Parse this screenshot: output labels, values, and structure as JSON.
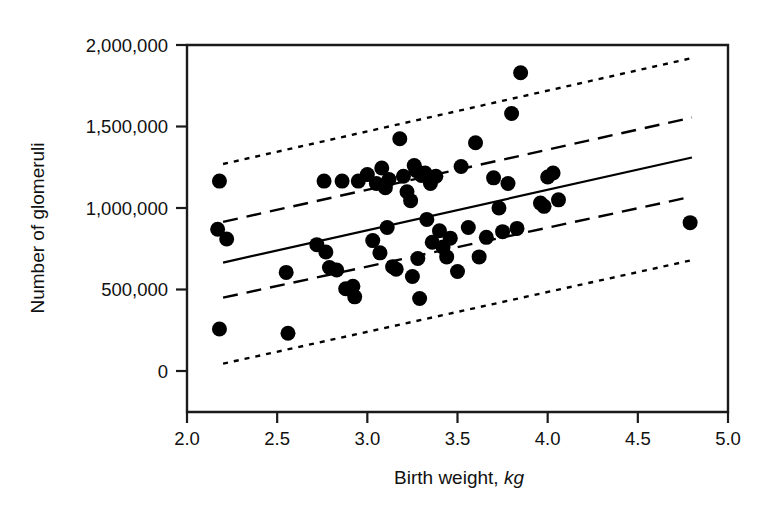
{
  "chart_data": {
    "type": "scatter",
    "title": "",
    "xlabel": "Birth weight, kg",
    "xlabel_main": "Birth weight,",
    "xlabel_unit": "kg",
    "ylabel": "Number of glomeruli",
    "xlim": [
      2.0,
      5.0
    ],
    "ylim": [
      0,
      2000000
    ],
    "xticks": [
      2.0,
      2.5,
      3.0,
      3.5,
      4.0,
      4.5,
      5.0
    ],
    "xticklabels": [
      "2.0",
      "2.5",
      "3.0",
      "3.5",
      "4.0",
      "4.5",
      "5.0"
    ],
    "yticks": [
      0,
      500000,
      1000000,
      1500000,
      2000000
    ],
    "yticklabels": [
      "0",
      "500,000",
      "1,000,000",
      "1,500,000",
      "2,000,000"
    ],
    "grid": false,
    "legend": null,
    "marker_color": "#000000",
    "marker_radius": 7.5,
    "points": [
      [
        2.18,
        1165000
      ],
      [
        2.17,
        870000
      ],
      [
        2.22,
        810000
      ],
      [
        2.18,
        258000
      ],
      [
        2.55,
        605000
      ],
      [
        2.56,
        232000
      ],
      [
        2.72,
        775000
      ],
      [
        2.76,
        1165000
      ],
      [
        2.77,
        730000
      ],
      [
        2.79,
        635000
      ],
      [
        2.83,
        620000
      ],
      [
        2.86,
        1165000
      ],
      [
        2.88,
        505000
      ],
      [
        2.92,
        520000
      ],
      [
        2.93,
        455000
      ],
      [
        2.95,
        1165000
      ],
      [
        3.0,
        1205000
      ],
      [
        3.03,
        800000
      ],
      [
        3.05,
        1150000
      ],
      [
        3.07,
        725000
      ],
      [
        3.08,
        1245000
      ],
      [
        3.1,
        1125000
      ],
      [
        3.11,
        880000
      ],
      [
        3.12,
        1175000
      ],
      [
        3.14,
        640000
      ],
      [
        3.16,
        625000
      ],
      [
        3.18,
        1425000
      ],
      [
        3.2,
        1195000
      ],
      [
        3.22,
        1100000
      ],
      [
        3.24,
        1045000
      ],
      [
        3.25,
        580000
      ],
      [
        3.26,
        1260000
      ],
      [
        3.27,
        1230000
      ],
      [
        3.28,
        690000
      ],
      [
        3.29,
        445000
      ],
      [
        3.3,
        1200000
      ],
      [
        3.32,
        1215000
      ],
      [
        3.33,
        930000
      ],
      [
        3.35,
        1150000
      ],
      [
        3.36,
        790000
      ],
      [
        3.38,
        1195000
      ],
      [
        3.4,
        860000
      ],
      [
        3.42,
        760000
      ],
      [
        3.44,
        700000
      ],
      [
        3.46,
        815000
      ],
      [
        3.5,
        610000
      ],
      [
        3.52,
        1255000
      ],
      [
        3.56,
        880000
      ],
      [
        3.6,
        1400000
      ],
      [
        3.62,
        700000
      ],
      [
        3.66,
        820000
      ],
      [
        3.7,
        1185000
      ],
      [
        3.73,
        1000000
      ],
      [
        3.75,
        855000
      ],
      [
        3.78,
        1150000
      ],
      [
        3.8,
        1580000
      ],
      [
        3.83,
        875000
      ],
      [
        3.85,
        1830000
      ],
      [
        3.96,
        1030000
      ],
      [
        3.98,
        1010000
      ],
      [
        4.0,
        1190000
      ],
      [
        4.03,
        1215000
      ],
      [
        4.06,
        1050000
      ],
      [
        4.79,
        910000
      ]
    ],
    "regression_line": {
      "name": "fitted-regression-line",
      "style": "solid",
      "x_start": 2.2,
      "y_start": 665000,
      "x_end": 4.8,
      "y_end": 1310000
    },
    "confidence_band": {
      "name": "confidence-interval",
      "style": "dashed",
      "upper": {
        "x_start": 2.2,
        "y_start": 915000,
        "x_end": 4.8,
        "y_end": 1555000
      },
      "lower": {
        "x_start": 2.2,
        "y_start": 450000,
        "x_end": 4.8,
        "y_end": 1070000
      }
    },
    "prediction_band": {
      "name": "prediction-interval",
      "style": "dotted",
      "upper": {
        "x_start": 2.2,
        "y_start": 1270000,
        "x_end": 4.8,
        "y_end": 1920000
      },
      "lower": {
        "x_start": 2.2,
        "y_start": 45000,
        "x_end": 4.8,
        "y_end": 680000
      }
    }
  }
}
